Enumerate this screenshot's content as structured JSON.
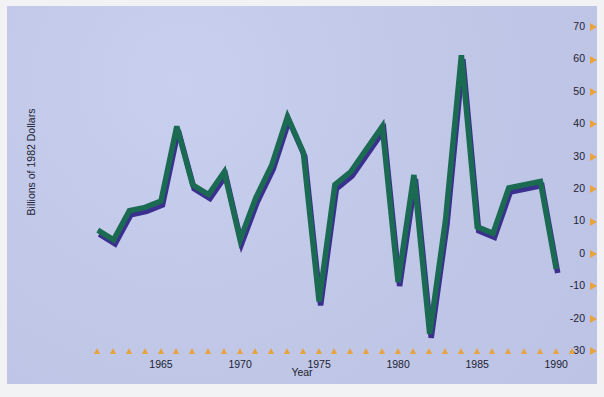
{
  "figure": {
    "background_color": "#c3caea",
    "page_color": "#f2f2f4",
    "line_color": "#1a6b52",
    "shadow_color": "#3b2f8f",
    "tick_color": "#e8a33d",
    "text_color": "#1d1d33"
  },
  "chart_data": {
    "type": "line",
    "title": "",
    "xlabel": "Year",
    "ylabel": "Billions of 1982 Dollars",
    "xlim": [
      1960,
      1991
    ],
    "ylim": [
      -30,
      70
    ],
    "yticks": [
      -30,
      -20,
      -10,
      0,
      10,
      20,
      30,
      40,
      50,
      60,
      70
    ],
    "ytick_labels": [
      "-30",
      "-20",
      "-10",
      "0",
      "10",
      "20",
      "30",
      "40",
      "50",
      "60",
      "70"
    ],
    "xticks": [
      1961,
      1962,
      1963,
      1964,
      1965,
      1966,
      1967,
      1968,
      1969,
      1970,
      1971,
      1972,
      1973,
      1974,
      1975,
      1976,
      1977,
      1978,
      1979,
      1980,
      1981,
      1982,
      1983,
      1984,
      1985,
      1986,
      1987,
      1988,
      1989,
      1990,
      1991
    ],
    "xtick_labels": [
      "1965",
      "1970",
      "1975",
      "1980",
      "1985",
      "1990"
    ],
    "xtick_label_values": [
      1965,
      1970,
      1975,
      1980,
      1985,
      1990
    ],
    "grid": false,
    "legend": null,
    "tick_marker": "triangle",
    "x": [
      1961,
      1962,
      1963,
      1964,
      1965,
      1966,
      1967,
      1968,
      1969,
      1970,
      1971,
      1972,
      1973,
      1974,
      1975,
      1976,
      1977,
      1978,
      1979,
      1980,
      1981,
      1982,
      1983,
      1984,
      1985,
      1986,
      1987,
      1988,
      1989,
      1990
    ],
    "values": [
      7,
      4,
      13,
      14,
      16,
      39,
      21,
      18,
      25,
      4,
      17,
      27,
      42,
      31,
      -15,
      21,
      25,
      32,
      39,
      -9,
      24,
      -25,
      10,
      61,
      8,
      6,
      20,
      21,
      22,
      -5
    ],
    "series": [
      {
        "name": "Billions of 1982 Dollars",
        "values": [
          7,
          4,
          13,
          14,
          16,
          39,
          21,
          18,
          25,
          4,
          17,
          27,
          42,
          31,
          -15,
          21,
          25,
          32,
          39,
          -9,
          24,
          -25,
          10,
          61,
          8,
          6,
          20,
          21,
          22,
          -5
        ]
      }
    ]
  }
}
